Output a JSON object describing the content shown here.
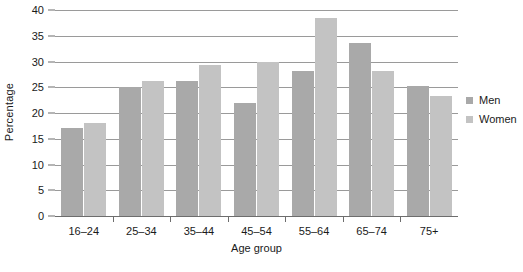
{
  "chart_data": {
    "type": "bar",
    "title": "",
    "xlabel": "Age group",
    "ylabel": "Percentage",
    "categories": [
      "16–24",
      "25–34",
      "35–44",
      "45–54",
      "55–64",
      "65–74",
      "75+"
    ],
    "series": [
      {
        "name": "Men",
        "color": "#a9a9a9",
        "values": [
          17.0,
          25.0,
          26.3,
          22.0,
          28.1,
          33.5,
          25.3
        ]
      },
      {
        "name": "Women",
        "color": "#c3c3c3",
        "values": [
          18.1,
          26.3,
          29.4,
          30.0,
          38.5,
          28.1,
          23.3
        ]
      }
    ],
    "ylim": [
      0,
      40
    ],
    "yticks": [
      0,
      5,
      10,
      15,
      20,
      25,
      30,
      35,
      40
    ],
    "ytick_labels": [
      "0",
      "5",
      "10",
      "15",
      "20",
      "25",
      "30",
      "35",
      "40"
    ],
    "grid": true,
    "grid_axis": "y",
    "legend_position": "right",
    "legend_entries": [
      "Men",
      "Women"
    ]
  }
}
